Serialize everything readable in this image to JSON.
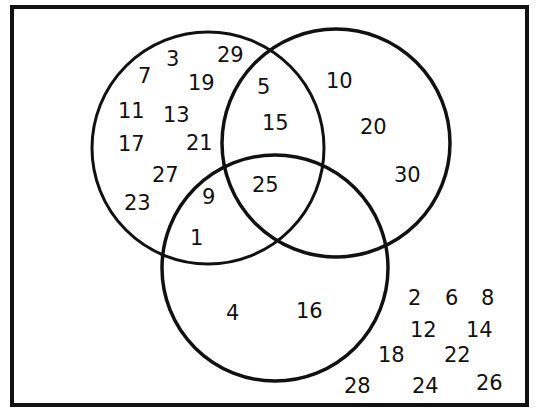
{
  "diagram": {
    "type": "venn",
    "universe": "integers 1 to 30",
    "sets": [
      {
        "id": "A",
        "name": "odd numbers"
      },
      {
        "id": "B",
        "name": "multiples of 5"
      },
      {
        "id": "C",
        "name": "perfect squares"
      }
    ],
    "regions": {
      "A_only": [
        "3",
        "29",
        "7",
        "19",
        "11",
        "13",
        "17",
        "21",
        "27",
        "23"
      ],
      "AB_only": [
        "5",
        "15"
      ],
      "B_only": [
        "10",
        "20",
        "30"
      ],
      "AC_only": [
        "9",
        "1"
      ],
      "ABC": [
        "25"
      ],
      "C_only": [
        "4",
        "16"
      ],
      "outside": [
        "2",
        "6",
        "8",
        "12",
        "14",
        "18",
        "22",
        "28",
        "24",
        "26"
      ]
    }
  },
  "labels": [
    {
      "text": "3",
      "x": 166,
      "y": 66
    },
    {
      "text": "29",
      "x": 217,
      "y": 62
    },
    {
      "text": "7",
      "x": 138,
      "y": 83
    },
    {
      "text": "19",
      "x": 188,
      "y": 90
    },
    {
      "text": "11",
      "x": 118,
      "y": 118
    },
    {
      "text": "13",
      "x": 163,
      "y": 122
    },
    {
      "text": "17",
      "x": 118,
      "y": 151
    },
    {
      "text": "21",
      "x": 186,
      "y": 150
    },
    {
      "text": "27",
      "x": 152,
      "y": 182
    },
    {
      "text": "23",
      "x": 124,
      "y": 210
    },
    {
      "text": "5",
      "x": 257,
      "y": 94
    },
    {
      "text": "15",
      "x": 262,
      "y": 130
    },
    {
      "text": "10",
      "x": 326,
      "y": 88
    },
    {
      "text": "20",
      "x": 360,
      "y": 134
    },
    {
      "text": "30",
      "x": 394,
      "y": 182
    },
    {
      "text": "9",
      "x": 202,
      "y": 204
    },
    {
      "text": "1",
      "x": 190,
      "y": 245
    },
    {
      "text": "25",
      "x": 252,
      "y": 192
    },
    {
      "text": "4",
      "x": 226,
      "y": 320
    },
    {
      "text": "16",
      "x": 296,
      "y": 318
    },
    {
      "text": "2",
      "x": 408,
      "y": 305
    },
    {
      "text": "6",
      "x": 445,
      "y": 305
    },
    {
      "text": "8",
      "x": 481,
      "y": 305
    },
    {
      "text": "12",
      "x": 410,
      "y": 337
    },
    {
      "text": "14",
      "x": 466,
      "y": 337
    },
    {
      "text": "18",
      "x": 378,
      "y": 362
    },
    {
      "text": "22",
      "x": 444,
      "y": 362
    },
    {
      "text": "28",
      "x": 344,
      "y": 393
    },
    {
      "text": "24",
      "x": 412,
      "y": 393
    },
    {
      "text": "26",
      "x": 476,
      "y": 390
    }
  ]
}
